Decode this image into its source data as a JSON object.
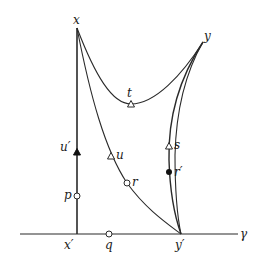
{
  "diagram": {
    "colors": {
      "stroke": "#2a2a2a",
      "fill_open": "#ffffff",
      "fill_solid": "#111111"
    },
    "labels": {
      "x": "x",
      "y": "y",
      "t": "t",
      "u_prime": "u′",
      "u": "u",
      "s": "s",
      "r_prime": "r′",
      "p": "p",
      "r": "r",
      "x_prime": "x′",
      "q": "q",
      "y_prime": "y′",
      "gamma": "γ"
    },
    "points": [
      {
        "id": "x",
        "pos": [
          77,
          28
        ],
        "marker": "none"
      },
      {
        "id": "y",
        "pos": [
          203,
          42
        ],
        "marker": "none"
      },
      {
        "id": "t",
        "pos": [
          131,
          104
        ],
        "marker": "open-triangle"
      },
      {
        "id": "u_prime",
        "pos": [
          77,
          152
        ],
        "marker": "solid-triangle"
      },
      {
        "id": "u",
        "pos": [
          111,
          156
        ],
        "marker": "open-triangle"
      },
      {
        "id": "s",
        "pos": [
          169,
          146
        ],
        "marker": "open-triangle"
      },
      {
        "id": "r_prime",
        "pos": [
          169,
          172
        ],
        "marker": "solid-circle"
      },
      {
        "id": "p",
        "pos": [
          77,
          196
        ],
        "marker": "open-circle"
      },
      {
        "id": "r",
        "pos": [
          127,
          183
        ],
        "marker": "open-circle"
      },
      {
        "id": "x_prime",
        "pos": [
          77,
          234
        ],
        "marker": "none"
      },
      {
        "id": "q",
        "pos": [
          109,
          234
        ],
        "marker": "open-circle"
      },
      {
        "id": "y_prime",
        "pos": [
          181,
          234
        ],
        "marker": "none"
      }
    ],
    "curves": [
      {
        "id": "geodesic-x-y-through-t",
        "from": "x",
        "to": "y",
        "via": "t"
      },
      {
        "id": "line-x-xprime",
        "from": "x",
        "to": "x_prime",
        "via": "u_prime,p"
      },
      {
        "id": "curve-x-yprime",
        "from": "x",
        "to": "y_prime",
        "via": "u,r"
      },
      {
        "id": "curve-y-yprime-outer",
        "from": "y",
        "to": "y_prime",
        "via": "s,r_prime"
      },
      {
        "id": "curve-y-yprime-inner",
        "from": "y",
        "to": "y_prime"
      },
      {
        "id": "baseline-gamma",
        "from": "left",
        "to": "right",
        "via": "x_prime,q,y_prime"
      }
    ]
  }
}
